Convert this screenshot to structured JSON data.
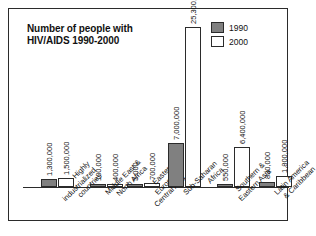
{
  "chart_data": {
    "type": "bar",
    "title": "Number of people with HIV/AIDS 1990-2000",
    "title_line1": "Number of people with",
    "title_line2": "HIV/AIDS 1990-2000",
    "xlabel": "",
    "ylabel": "",
    "ylim": [
      0,
      25300000
    ],
    "grid": false,
    "legend_position": "top-right",
    "categories": [
      "Highly industrialized countries",
      "Middle East & North Africa",
      "Eastern Europe & Central Asia",
      "Sub-Saharan Africa",
      "Southern & Eastern Asia",
      "Latin America & Caribbean"
    ],
    "category_lines": [
      [
        "Highly",
        "industrialized",
        "countries"
      ],
      [
        "Middle East &",
        "North Africa"
      ],
      [
        "Eastern",
        "Europe &",
        "Central Asia"
      ],
      [
        "Sub-Saharan",
        "Africa"
      ],
      [
        "Southern &",
        "Eastern Asia"
      ],
      [
        "Latin America",
        "& Caribbean"
      ]
    ],
    "series": [
      {
        "name": "1990",
        "color": "#808080",
        "values": [
          1300000,
          100000,
          5000,
          7000000,
          550000,
          830000
        ],
        "labels": [
          "1,300,000",
          "100,000",
          "5,000",
          "7,000,000",
          "550,000",
          "830,000"
        ]
      },
      {
        "name": "2000",
        "color": "#ffffff",
        "values": [
          1500000,
          400000,
          700000,
          25300000,
          6400000,
          1800000
        ],
        "labels": [
          "1,500,000",
          "400,000",
          "700,000",
          "25,300,000",
          "6,400,000",
          "1,800,000"
        ]
      }
    ]
  },
  "legend": {
    "items": [
      {
        "label": "1990",
        "color": "#808080"
      },
      {
        "label": "2000",
        "color": "#ffffff"
      }
    ]
  },
  "colors": {
    "series_1990": "#808080",
    "series_2000": "#ffffff",
    "outline": "#2b2b2b",
    "background": "#ffffff",
    "text": "#111111"
  }
}
